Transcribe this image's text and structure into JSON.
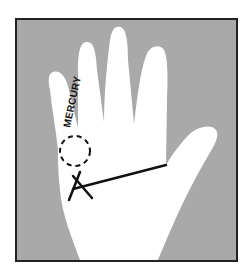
{
  "diagram": {
    "labels": {
      "mercury_finger": "MERCURY"
    },
    "colors": {
      "background": "#a9a9a9",
      "hand": "#ffffff",
      "frame": "#222222",
      "ink": "#111111"
    },
    "markings": [
      {
        "type": "dashed-circle",
        "location": "mount of Mercury"
      },
      {
        "type": "cross",
        "location": "end of heart line below Mercury"
      },
      {
        "type": "line",
        "location": "heart line across palm"
      }
    ]
  }
}
